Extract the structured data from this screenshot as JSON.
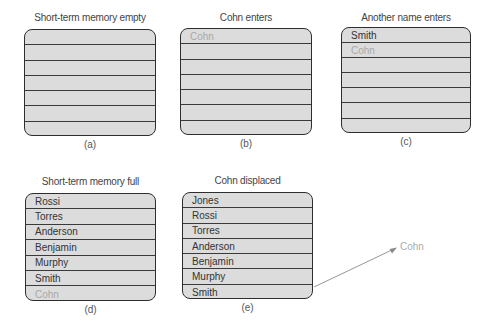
{
  "panels": [
    {
      "id": "a",
      "title": "Short-term memory empty",
      "caption": "(a)",
      "rows": [
        {
          "text": "",
          "faded": false
        },
        {
          "text": "",
          "faded": false
        },
        {
          "text": "",
          "faded": false
        },
        {
          "text": "",
          "faded": false
        },
        {
          "text": "",
          "faded": false
        },
        {
          "text": "",
          "faded": false
        },
        {
          "text": "",
          "faded": false
        }
      ]
    },
    {
      "id": "b",
      "title": "Cohn enters",
      "caption": "(b)",
      "rows": [
        {
          "text": "Cohn",
          "faded": true
        },
        {
          "text": "",
          "faded": false
        },
        {
          "text": "",
          "faded": false
        },
        {
          "text": "",
          "faded": false
        },
        {
          "text": "",
          "faded": false
        },
        {
          "text": "",
          "faded": false
        },
        {
          "text": "",
          "faded": false
        }
      ]
    },
    {
      "id": "c",
      "title": "Another name enters",
      "caption": "(c)",
      "rows": [
        {
          "text": "Smith",
          "faded": false
        },
        {
          "text": "Cohn",
          "faded": true
        },
        {
          "text": "",
          "faded": false
        },
        {
          "text": "",
          "faded": false
        },
        {
          "text": "",
          "faded": false
        },
        {
          "text": "",
          "faded": false
        },
        {
          "text": "",
          "faded": false
        }
      ]
    },
    {
      "id": "d",
      "title": "Short-term memory full",
      "caption": "(d)",
      "rows": [
        {
          "text": "Rossi",
          "faded": false
        },
        {
          "text": "Torres",
          "faded": false
        },
        {
          "text": "Anderson",
          "faded": false
        },
        {
          "text": "Benjamin",
          "faded": false
        },
        {
          "text": "Murphy",
          "faded": false
        },
        {
          "text": "Smith",
          "faded": false
        },
        {
          "text": "Cohn",
          "faded": true
        }
      ]
    },
    {
      "id": "e",
      "title": "Cohn displaced",
      "caption": "(e)",
      "rows": [
        {
          "text": "Jones",
          "faded": false
        },
        {
          "text": "Rossi",
          "faded": false
        },
        {
          "text": "Torres",
          "faded": false
        },
        {
          "text": "Anderson",
          "faded": false
        },
        {
          "text": "Benjamin",
          "faded": false
        },
        {
          "text": "Murphy",
          "faded": false
        },
        {
          "text": "Smith",
          "faded": false
        }
      ]
    }
  ],
  "displaced": {
    "label": "Cohn"
  },
  "colors": {
    "box_fill": "#dcdcdc",
    "box_border": "#2e2e2e",
    "faded_text": "#a8a8a8",
    "arrow": "#8a8a8a"
  }
}
